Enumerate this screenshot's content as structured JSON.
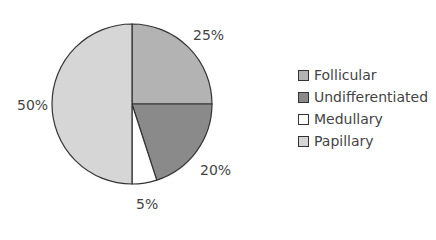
{
  "chart_data": {
    "type": "pie",
    "title": "",
    "categories": [
      "Follicular",
      "Undifferentiated",
      "Medullary",
      "Papillary"
    ],
    "values": [
      25,
      20,
      5,
      50
    ],
    "labels": [
      "25%",
      "20%",
      "5%",
      "50%"
    ],
    "colors": [
      "#b3b3b3",
      "#8a8a8a",
      "#ffffff",
      "#d6d6d6"
    ],
    "legend_position": "right",
    "start_angle": "12 o'clock, clockwise"
  },
  "legend": [
    {
      "label": "Follicular",
      "color": "#b3b3b3"
    },
    {
      "label": "Undifferentiated",
      "color": "#8a8a8a"
    },
    {
      "label": "Medullary",
      "color": "#ffffff"
    },
    {
      "label": "Papillary",
      "color": "#d6d6d6"
    }
  ]
}
